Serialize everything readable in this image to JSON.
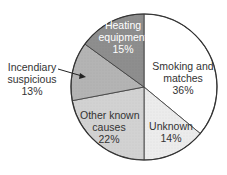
{
  "chart_data": {
    "type": "pie",
    "title": "",
    "start_angle_deg": 0,
    "direction": "clockwise",
    "slices": [
      {
        "label": "Smoking and matches",
        "value": 36,
        "display": "36%",
        "color": "#ffffff"
      },
      {
        "label": "Unknown",
        "value": 14,
        "display": "14%",
        "color": "#ececec"
      },
      {
        "label": "Other known causes",
        "value": 22,
        "display": "22%",
        "color": "#d2d2d2"
      },
      {
        "label": "Incendiary suspicious",
        "value": 13,
        "display": "13%",
        "color": "#b4b4b4"
      },
      {
        "label": "Heating equipment",
        "value": 15,
        "display": "15%",
        "color": "#8e8e8e"
      }
    ]
  },
  "labels": {
    "smoking": {
      "line1": "Smoking and",
      "line2": "matches",
      "pct": "36%"
    },
    "unknown": {
      "line1": "Unknown",
      "pct": "14%"
    },
    "other": {
      "line1": "Other known",
      "line2": "causes",
      "pct": "22%"
    },
    "incendiary": {
      "line1": "Incendiary",
      "line2": "suspicious",
      "pct": "13%"
    },
    "heating": {
      "line1": "Heating",
      "line2": "equipment",
      "pct": "15%"
    }
  }
}
